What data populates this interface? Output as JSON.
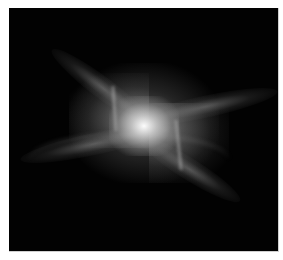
{
  "image": {
    "subject": "bipolar X-shaped nebula, grayscale",
    "background_color": "#020202",
    "frame_border_color": "#cfcfcf",
    "page_background": "#ffffff"
  }
}
